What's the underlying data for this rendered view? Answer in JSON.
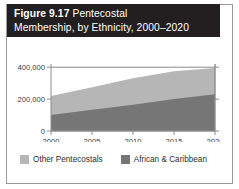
{
  "figure": {
    "label": "Figure 9.17",
    "title_rest": "Pentecostal",
    "title_line2": "Membership, by Ethnicity, 2000–2020"
  },
  "legend": {
    "items": [
      {
        "label": "Other Pentecostals",
        "color": "#b6b6b6"
      },
      {
        "label": "African & Caribbean",
        "color": "#767676"
      }
    ]
  },
  "colors": {
    "title_bar": "#231f20",
    "series_light": "#b6b6b6",
    "series_dark": "#767676",
    "axis": "#8c8c8c",
    "frame": "#9a9a9a",
    "text": "#3b3b3b"
  },
  "chart_data": {
    "type": "area",
    "stacked": true,
    "title": "Figure 9.17 Pentecostal Membership, by Ethnicity, 2000–2020",
    "xlabel": "",
    "ylabel": "",
    "x": [
      2000,
      2005,
      2010,
      2015,
      2020
    ],
    "xticklabels": [
      "2000",
      "2005",
      "2010",
      "2015",
      "2020"
    ],
    "xlim": [
      2000,
      2020
    ],
    "yticks": [
      0,
      200000,
      400000
    ],
    "yticklabels": [
      "0",
      "200,000",
      "400,000"
    ],
    "ylim": [
      0,
      420000
    ],
    "grid": false,
    "legend_position": "bottom",
    "series": [
      {
        "name": "African & Caribbean",
        "color": "#767676",
        "values": [
          100000,
          133000,
          165000,
          200000,
          230000
        ]
      },
      {
        "name": "Other Pentecostals",
        "color": "#b6b6b6",
        "values": [
          120000,
          142000,
          165000,
          175000,
          165000
        ]
      }
    ],
    "totals": [
      220000,
      275000,
      330000,
      375000,
      395000
    ]
  }
}
